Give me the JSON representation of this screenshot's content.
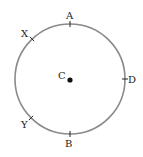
{
  "diagram": {
    "type": "circle-with-labeled-points",
    "colors": {
      "circle_stroke": "#8a8a8a",
      "tick": "#222222",
      "center_dot": "#111111",
      "label": "#222222"
    },
    "circle": {
      "cx": 70,
      "cy": 79,
      "r": 55
    },
    "center": {
      "label": "C",
      "x": 70,
      "y": 80,
      "label_x": 58,
      "label_y": 79
    },
    "points": [
      {
        "id": "A",
        "label": "A",
        "x": 70,
        "y": 24,
        "label_x": 66,
        "label_y": 19,
        "tick": "vertical"
      },
      {
        "id": "B",
        "label": "B",
        "x": 70,
        "y": 134,
        "label_x": 65,
        "label_y": 147,
        "tick": "vertical"
      },
      {
        "id": "D",
        "label": "D",
        "x": 125,
        "y": 79,
        "label_x": 128,
        "label_y": 83,
        "tick": "horizontal"
      },
      {
        "id": "X",
        "label": "X",
        "x": 32,
        "y": 39,
        "label_x": 21,
        "label_y": 37,
        "tick": "diag1"
      },
      {
        "id": "Y",
        "label": "Y",
        "x": 31,
        "y": 118,
        "label_x": 21,
        "label_y": 128,
        "tick": "diag2"
      }
    ]
  }
}
